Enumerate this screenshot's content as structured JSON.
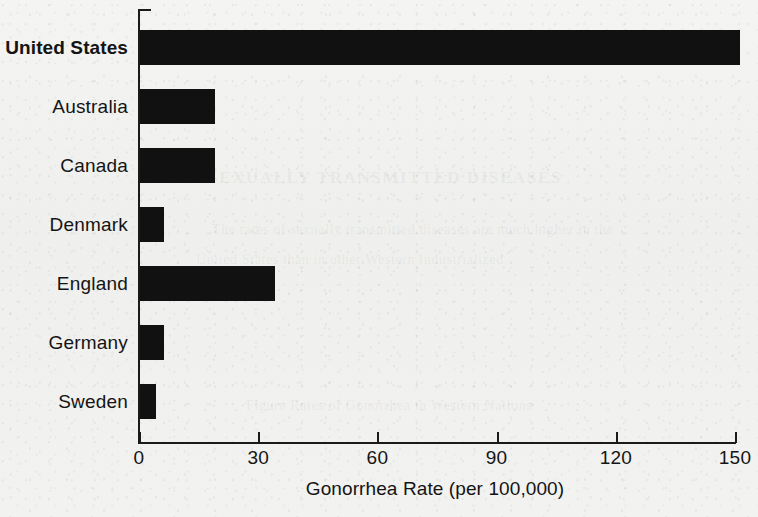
{
  "chart_data": {
    "type": "bar",
    "orientation": "horizontal",
    "title": "",
    "xlabel": "Gonorrhea Rate (per 100,000)",
    "ylabel": "",
    "categories": [
      "United States",
      "Australia",
      "Canada",
      "Denmark",
      "England",
      "Germany",
      "Sweden"
    ],
    "values": [
      151,
      19,
      19,
      6,
      34,
      6,
      4
    ],
    "highlight_category": "United States",
    "xlim": [
      0,
      150
    ],
    "xticks": [
      0,
      30,
      60,
      90,
      120,
      150
    ],
    "xtick_labels": [
      "0",
      "30",
      "60",
      "90",
      "120",
      "150"
    ],
    "grid": false,
    "legend": false,
    "bar_color": "#111111",
    "background_color": "#f1f1ef"
  },
  "ghost_text": {
    "heading": "SEXUALLY TRANSMITTED DISEASES",
    "line1": "The rates of sexually transmitted diseases are much higher in the",
    "line2": "United States than in other Western industrialized",
    "line3": "countries.",
    "caption": "Figure  Rates of Gonorrhea in Western Nations"
  }
}
